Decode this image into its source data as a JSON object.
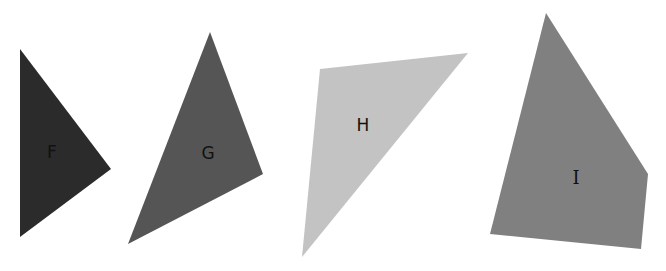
{
  "shapes": [
    {
      "id": "F",
      "label": "F",
      "type": "triangle",
      "fill": "#2b2b2b",
      "points": "20,49 111,169 20,237",
      "label_pos": [
        52,
        158
      ]
    },
    {
      "id": "G",
      "label": "G",
      "type": "triangle",
      "fill": "#555555",
      "points": "210,32 263,174 128,244",
      "label_pos": [
        208,
        159
      ]
    },
    {
      "id": "H",
      "label": "H",
      "type": "triangle",
      "fill": "#c3c3c3",
      "points": "320,69 468,53 302,257",
      "label_pos": [
        363,
        131
      ]
    },
    {
      "id": "I",
      "label": "I",
      "type": "quadrilateral",
      "fill": "#808080",
      "points": "546,13 648,174 641,249 490,234",
      "label_pos": [
        576,
        184
      ]
    }
  ]
}
